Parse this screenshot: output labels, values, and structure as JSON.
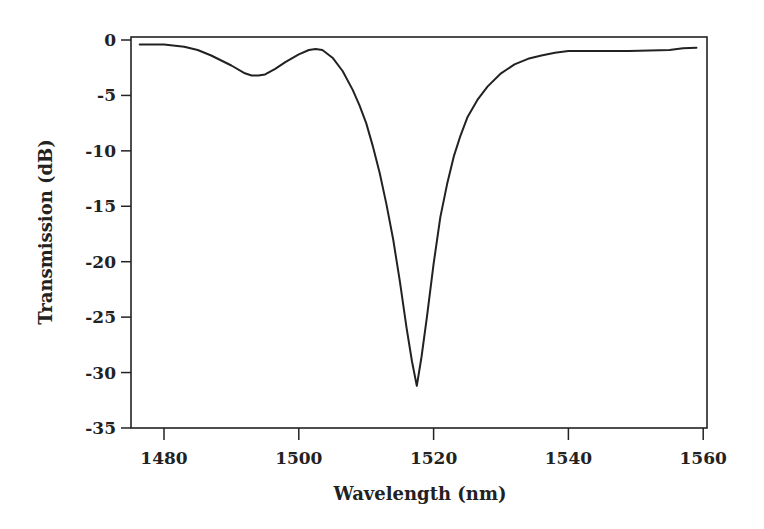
{
  "chart_data": {
    "type": "line",
    "title": "",
    "xlabel": "Wavelength (nm)",
    "ylabel": "Transmission (dB)",
    "xlim": [
      1475,
      1560.5
    ],
    "ylim": [
      -35,
      0.3
    ],
    "xticks": [
      1480,
      1500,
      1520,
      1540,
      1560
    ],
    "yticks": [
      0,
      -5,
      -10,
      -15,
      -20,
      -25,
      -30,
      -35
    ],
    "xtick_labels": [
      "1480",
      "1500",
      "1520",
      "1540",
      "1560"
    ],
    "ytick_labels": [
      "0",
      "-5",
      "-10",
      "-15",
      "-20",
      "-25",
      "-30",
      "-35"
    ],
    "grid": false,
    "legend": null,
    "series": [
      {
        "name": "Transmission",
        "color": "#222222",
        "x": [
          1476.4,
          1480,
          1483,
          1485,
          1487,
          1490,
          1492,
          1493,
          1494,
          1495,
          1496.5,
          1498,
          1500,
          1501.5,
          1502.5,
          1503.5,
          1505,
          1506.5,
          1508,
          1509,
          1510,
          1511,
          1512,
          1513,
          1514,
          1515,
          1516,
          1516.8,
          1517.5,
          1518.2,
          1519,
          1520,
          1521,
          1522,
          1523,
          1524,
          1525,
          1526.5,
          1528,
          1530,
          1532,
          1534,
          1536,
          1538,
          1540,
          1545,
          1549,
          1552,
          1555,
          1557,
          1559
        ],
        "y": [
          -0.4,
          -0.4,
          -0.6,
          -0.9,
          -1.4,
          -2.3,
          -3.0,
          -3.2,
          -3.2,
          -3.1,
          -2.6,
          -2.0,
          -1.3,
          -0.9,
          -0.8,
          -0.9,
          -1.6,
          -2.8,
          -4.5,
          -5.9,
          -7.5,
          -9.6,
          -12.0,
          -14.8,
          -18.0,
          -21.8,
          -26.0,
          -29.0,
          -31.2,
          -28.6,
          -25.0,
          -20.2,
          -16.0,
          -13.0,
          -10.5,
          -8.6,
          -7.0,
          -5.4,
          -4.2,
          -3.0,
          -2.2,
          -1.7,
          -1.4,
          -1.15,
          -1.0,
          -1.0,
          -1.0,
          -0.95,
          -0.9,
          -0.75,
          -0.7
        ]
      }
    ]
  },
  "plot": {
    "x_axis_title": "Wavelength (nm)",
    "y_axis_title": "Transmission (dB)"
  }
}
